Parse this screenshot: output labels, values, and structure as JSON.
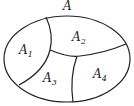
{
  "diagram": {
    "type": "set-partition",
    "set_label": "A",
    "regions": [
      {
        "base": "A",
        "sub": "1"
      },
      {
        "base": "A",
        "sub": "2"
      },
      {
        "base": "A",
        "sub": "3"
      },
      {
        "base": "A",
        "sub": "4"
      }
    ],
    "stroke_color": "#222222",
    "background": "#ffffff"
  }
}
